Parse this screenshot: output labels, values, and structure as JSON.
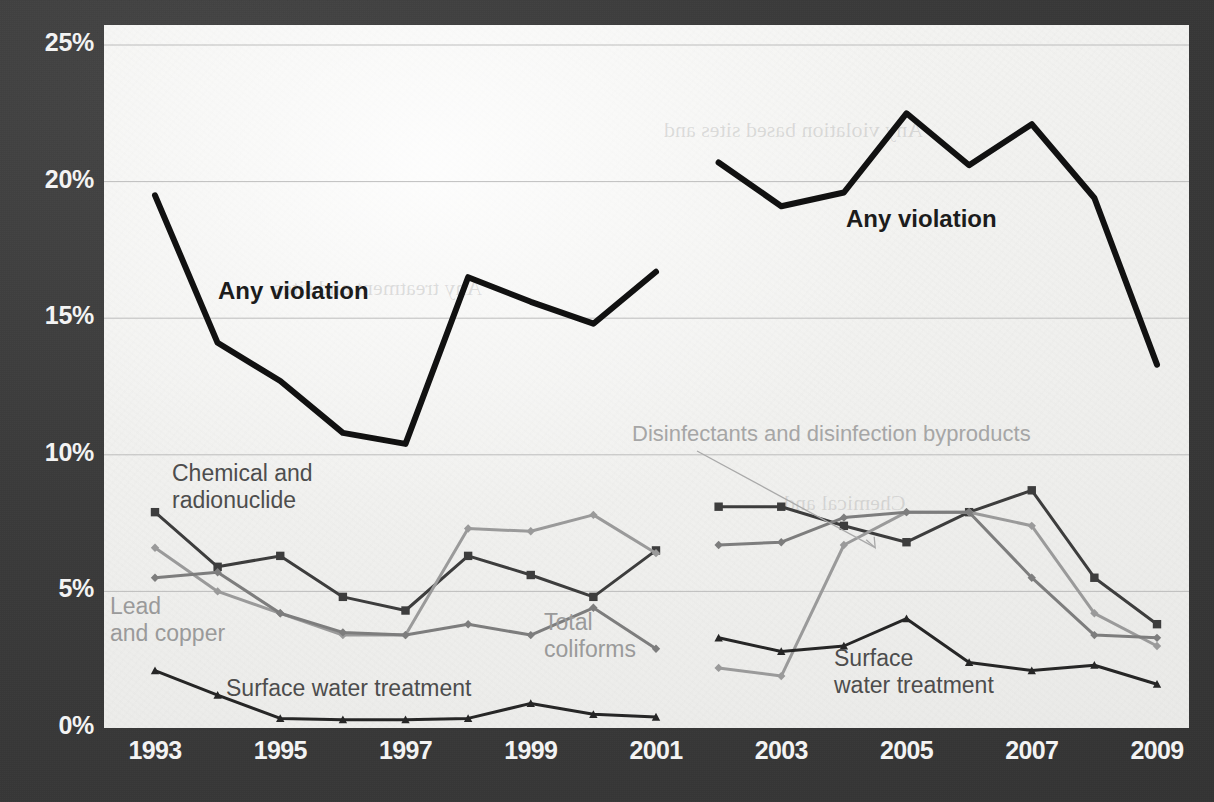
{
  "figure": {
    "background_color": "#3a3a3a",
    "plot_background_color": "#f2f2f0",
    "gridline_color": "#b4b4b4"
  },
  "axes": {
    "y_ticks": [
      "25%",
      "20%",
      "15%",
      "10%",
      "5%",
      "0%"
    ],
    "y_values": [
      25,
      20,
      15,
      10,
      5,
      0
    ],
    "x_ticks": [
      "1993",
      "1995",
      "1997",
      "1999",
      "2001",
      "2003",
      "2005",
      "2007",
      "2009"
    ],
    "x_tick_values": [
      1993,
      1995,
      1997,
      1999,
      2001,
      2003,
      2005,
      2007,
      2009
    ]
  },
  "annotations": {
    "any_violation_left": "Any violation",
    "any_violation_right": "Any violation",
    "chemical_radionuclide": "Chemical and\nradionuclide",
    "lead_and_copper": "Lead\nand copper",
    "total_coliforms": "Total\ncoliforms",
    "surface_water_treatment_left": "Surface water treatment",
    "surface_water_treatment_right": "Surface\nwater treatment",
    "disinfectants": "Disinfectants and disinfection byproducts"
  },
  "ghost_text": {
    "top_right": "Any violation based sites and",
    "mid_left": "Any treatment and sites",
    "mid_right": "Chemical and"
  },
  "chart_data": {
    "type": "line",
    "title": "",
    "xlabel": "",
    "ylabel": "",
    "xlim": [
      1992.5,
      2009.5
    ],
    "ylim": [
      0,
      26.5
    ],
    "ytick_format": "percent",
    "grid": "horizontal",
    "legend": "inline-annotations",
    "note": "Two disjoint eras plotted per series: 1993-2001 and 2002-2009 (break between 2001 and 2002).",
    "series": [
      {
        "name": "Any violation",
        "color": "#111111",
        "width": 6,
        "marker": "none",
        "segments": [
          {
            "x": [
              1993,
              1994,
              1995,
              1996,
              1997,
              1998,
              1999,
              2000,
              2001
            ],
            "y": [
              19.5,
              14.1,
              12.7,
              10.8,
              10.4,
              16.5,
              15.6,
              14.8,
              16.7
            ]
          },
          {
            "x": [
              2002,
              2003,
              2004,
              2005,
              2006,
              2007,
              2008,
              2009
            ],
            "y": [
              20.7,
              19.1,
              19.6,
              22.5,
              20.6,
              22.1,
              19.4,
              13.3
            ]
          }
        ]
      },
      {
        "name": "Chemical and radionuclide",
        "color": "#3d3d3d",
        "width": 3,
        "marker": "square",
        "segments": [
          {
            "x": [
              1993,
              1994,
              1995,
              1996,
              1997,
              1998,
              1999,
              2000,
              2001
            ],
            "y": [
              7.9,
              5.9,
              6.3,
              4.8,
              4.3,
              6.3,
              5.6,
              4.8,
              6.5
            ]
          },
          {
            "x": [
              2002,
              2003,
              2004,
              2005,
              2006,
              2007,
              2008,
              2009
            ],
            "y": [
              8.1,
              8.1,
              7.4,
              6.8,
              7.9,
              8.7,
              5.5,
              3.8
            ]
          }
        ]
      },
      {
        "name": "Lead and copper",
        "color": "#9a9a9a",
        "width": 3,
        "marker": "diamond",
        "segments": [
          {
            "x": [
              1993,
              1994,
              1995,
              1996,
              1997,
              1998,
              1999,
              2000,
              2001
            ],
            "y": [
              6.6,
              5.0,
              4.2,
              3.4,
              3.4,
              7.3,
              7.2,
              7.8,
              6.4
            ]
          },
          {
            "x": [
              2002,
              2003,
              2004,
              2005,
              2006,
              2007,
              2008,
              2009
            ],
            "y": [
              2.2,
              1.9,
              6.7,
              7.9,
              7.9,
              7.4,
              4.2,
              3.0
            ]
          }
        ]
      },
      {
        "name": "Total coliforms",
        "color": "#7d7d7d",
        "width": 3,
        "marker": "diamond",
        "segments": [
          {
            "x": [
              1993,
              1994,
              1995,
              1996,
              1997,
              1998,
              1999,
              2000,
              2001
            ],
            "y": [
              5.5,
              5.7,
              4.2,
              3.5,
              3.4,
              3.8,
              3.4,
              4.4,
              2.9
            ]
          },
          {
            "x": [
              2002,
              2003,
              2004,
              2005,
              2006,
              2007,
              2008,
              2009
            ],
            "y": [
              6.7,
              6.8,
              7.7,
              7.9,
              7.9,
              5.5,
              3.4,
              3.3
            ]
          }
        ]
      },
      {
        "name": "Surface water treatment",
        "color": "#262626",
        "width": 3,
        "marker": "triangle",
        "segments": [
          {
            "x": [
              1993,
              1994,
              1995,
              1996,
              1997,
              1998,
              1999,
              2000,
              2001
            ],
            "y": [
              2.1,
              1.2,
              0.35,
              0.3,
              0.3,
              0.35,
              0.9,
              0.5,
              0.4
            ]
          },
          {
            "x": [
              2002,
              2003,
              2004,
              2005,
              2006,
              2007,
              2008,
              2009
            ],
            "y": [
              3.3,
              2.8,
              3.0,
              4.0,
              2.4,
              2.1,
              2.3,
              1.6
            ]
          }
        ]
      },
      {
        "name": "Disinfectants and disinfection byproducts",
        "color": "#9a9a9a",
        "width": 3,
        "marker": "diamond",
        "pointer_target": {
          "x": 2004.5,
          "y": 6.6
        },
        "segments": []
      }
    ]
  }
}
